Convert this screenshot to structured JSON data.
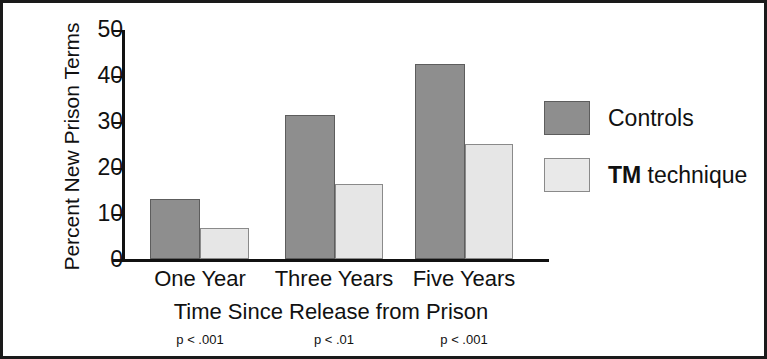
{
  "chart_data": {
    "type": "bar",
    "title": "",
    "xlabel": "Time Since Release from Prison",
    "ylabel": "Percent New Prison Terms",
    "categories": [
      "One Year",
      "Three Years",
      "Five Years"
    ],
    "ylim": [
      0,
      50
    ],
    "yticks": [
      0,
      10,
      20,
      30,
      40,
      50
    ],
    "ytick_labels": [
      "0",
      "10",
      "20",
      "30",
      "40",
      "50"
    ],
    "grid": false,
    "legend_position": "right",
    "series": [
      {
        "name": "Controls",
        "legend_label": "Controls",
        "color": "#8e8e8e",
        "values": [
          13.0,
          31.5,
          42.5
        ]
      },
      {
        "name": "TM technique",
        "legend_label_bold": "TM",
        "legend_label_rest": " technique",
        "color": "#e6e6e6",
        "values": [
          6.7,
          16.4,
          25.2
        ]
      }
    ],
    "annotations": [
      "p < .001",
      "p < .01",
      "p < .001"
    ]
  },
  "axes": {
    "y_title": "Percent New Prison Terms",
    "x_title": "Time Since Release from Prison",
    "y_ticks": [
      {
        "label": "50",
        "value": 50
      },
      {
        "label": "40",
        "value": 40
      },
      {
        "label": "30",
        "value": 30
      },
      {
        "label": "20",
        "value": 20
      },
      {
        "label": "10",
        "value": 10
      },
      {
        "label": "0",
        "value": 0
      }
    ]
  },
  "groups": [
    {
      "label": "One Year",
      "pvalue": "p < .001",
      "controls": 13.0,
      "tm": 6.7
    },
    {
      "label": "Three Years",
      "pvalue": "p < .01",
      "controls": 31.5,
      "tm": 16.4
    },
    {
      "label": "Five Years",
      "pvalue": "p < .001",
      "controls": 42.5,
      "tm": 25.2
    }
  ],
  "legend": {
    "controls_label": "Controls",
    "tm_label_bold": "TM",
    "tm_label_rest": " technique"
  }
}
